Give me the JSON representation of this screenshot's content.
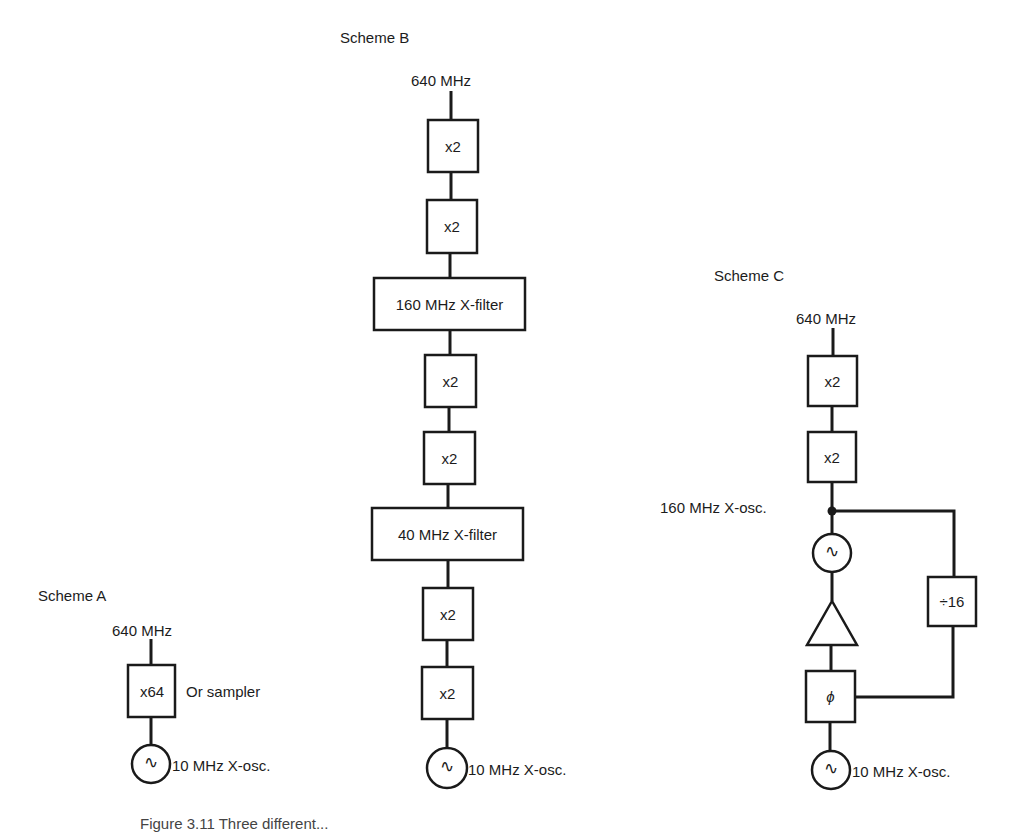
{
  "scheme_a": {
    "title": "Scheme A",
    "output": "640 MHz",
    "multiplier": "x64",
    "note": "Or sampler",
    "oscillator_label": "10 MHz X-osc."
  },
  "scheme_b": {
    "title": "Scheme B",
    "output": "640 MHz",
    "blocks": [
      "x2",
      "x2",
      "160 MHz X-filter",
      "x2",
      "x2",
      "40 MHz X-filter",
      "x2",
      "x2"
    ],
    "oscillator_label": "10 MHz X-osc."
  },
  "scheme_c": {
    "title": "Scheme C",
    "output": "640 MHz",
    "blocks": [
      "x2",
      "x2"
    ],
    "vco_label": "160 MHz X-osc.",
    "divider": "÷16",
    "phase_detector": "ϕ",
    "oscillator_label": "10 MHz X-osc."
  },
  "symbols": {
    "oscillator": "∿",
    "amplifier": "triangle"
  },
  "caption": "Figure 3.11  Three different..."
}
